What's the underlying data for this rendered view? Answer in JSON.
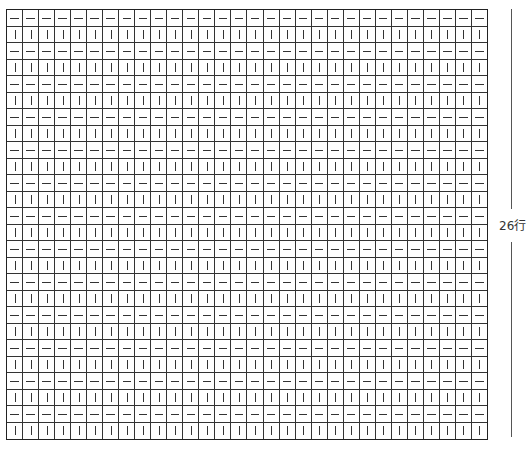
{
  "chart": {
    "type": "knitting-chart",
    "columns": 30,
    "rows": 26,
    "row_pattern": [
      "purl",
      "knit"
    ],
    "symbols": {
      "purl": "—",
      "knit": "|"
    },
    "first_row_symbol": "purl",
    "last_row_symbol": "knit"
  },
  "labels": {
    "rows_label": "26行",
    "cols_label": ""
  }
}
